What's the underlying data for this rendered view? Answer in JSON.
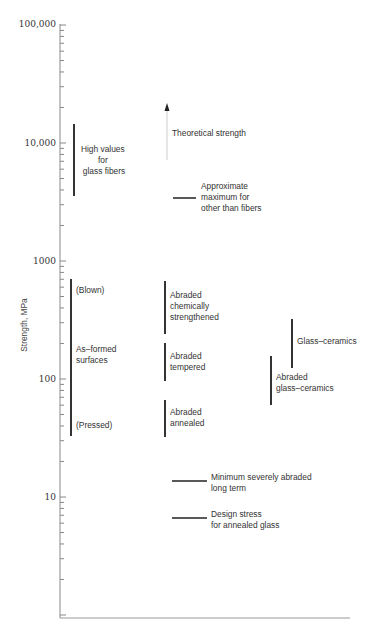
{
  "chart_data": {
    "type": "range-bar",
    "title": "",
    "xlabel": "",
    "ylabel": "Strength, MPa",
    "yscale": "log",
    "ylim": [
      1,
      100000
    ],
    "grid": false,
    "legend": null,
    "y_ticks": [
      {
        "value": 100000,
        "label": "100,000"
      },
      {
        "value": 10000,
        "label": "10,000"
      },
      {
        "value": 1000,
        "label": "1000"
      },
      {
        "value": 100,
        "label": "100"
      },
      {
        "value": 10,
        "label": "10"
      }
    ],
    "series": [
      {
        "name": "High values for glass fibers",
        "kind": "range",
        "column": 1,
        "low": 3600,
        "high": 14800,
        "label_lines": [
          "High values",
          "for",
          "glass fibers"
        ]
      },
      {
        "name": "As-formed surfaces",
        "kind": "range",
        "column": 1,
        "low": 33,
        "high": 700,
        "label_lines": [
          "As–formed",
          "surfaces"
        ],
        "annotations": [
          {
            "text": "(Blown)",
            "value": 580
          },
          {
            "text": "(Pressed)",
            "value": 45
          }
        ]
      },
      {
        "name": "Theoretical strength",
        "kind": "arrow",
        "column": 2,
        "low": 7000,
        "high": 20000,
        "label_lines": [
          "Theoretical strength"
        ]
      },
      {
        "name": "Approximate maximum for other than fibers",
        "kind": "level",
        "column": 2,
        "value": 3400,
        "label_lines": [
          "Approximate",
          "maximum for",
          "other than fibers"
        ]
      },
      {
        "name": "Abraded chemically strengthened",
        "kind": "range",
        "column": 2,
        "low": 240,
        "high": 690,
        "label_lines": [
          "Abraded",
          "chemically",
          "strengthened"
        ]
      },
      {
        "name": "Abraded tempered",
        "kind": "range",
        "column": 2,
        "low": 95,
        "high": 200,
        "label_lines": [
          "Abraded",
          "tempered"
        ]
      },
      {
        "name": "Abraded annealed",
        "kind": "range",
        "column": 2,
        "low": 33,
        "high": 67,
        "label_lines": [
          "Abraded",
          "annealed"
        ]
      },
      {
        "name": "Minimum severely abraded long term",
        "kind": "level",
        "column": 2,
        "value": 13.7,
        "label_lines": [
          "Minimum severely abraded",
          "long term"
        ]
      },
      {
        "name": "Design stress for annealed glass",
        "kind": "level",
        "column": 2,
        "value": 6.6,
        "label_lines": [
          "Design stress",
          "for annealed glass"
        ]
      },
      {
        "name": "Glass-ceramics",
        "kind": "range",
        "column": 4,
        "low": 125,
        "high": 330,
        "label_lines": [
          "Glass–ceramics"
        ]
      },
      {
        "name": "Abraded glass-ceramics",
        "kind": "range",
        "column": 3,
        "low": 60,
        "high": 155,
        "label_lines": [
          "Abraded",
          "glass–ceramics"
        ]
      }
    ]
  },
  "axis": {
    "ylabel": "Strength, MPa",
    "tick_100000": "100,000",
    "tick_10000": "10,000",
    "tick_1000": "1000",
    "tick_100": "100",
    "tick_10": "10"
  },
  "labels": {
    "glass_fibers": [
      "High values",
      "for",
      "glass fibers"
    ],
    "theoretical": "Theoretical strength",
    "approx_max": [
      "Approximate",
      "maximum for",
      "other than fibers"
    ],
    "blown": "(Blown)",
    "as_formed": [
      "As–formed",
      "surfaces"
    ],
    "pressed": "(Pressed)",
    "chem": [
      "Abraded",
      "chemically",
      "strengthened"
    ],
    "tempered": [
      "Abraded",
      "tempered"
    ],
    "annealed": [
      "Abraded",
      "annealed"
    ],
    "glass_ceramics": "Glass–ceramics",
    "abraded_gc": [
      "Abraded",
      "glass–ceramics"
    ],
    "min_abraded": [
      "Minimum severely abraded",
      "long term"
    ],
    "design_stress": [
      "Design stress",
      "for annealed glass"
    ]
  }
}
